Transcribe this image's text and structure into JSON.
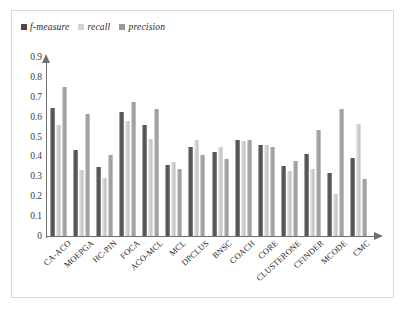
{
  "figure": {
    "background_color": "#ffffff",
    "frame_color": "#d9d9d9"
  },
  "legend": {
    "position": "top-left",
    "entries": [
      {
        "label": "f-measure",
        "color": "#4a4a4a",
        "key": "f_measure"
      },
      {
        "label": "recall",
        "color": "#d2d2d2",
        "key": "recall"
      },
      {
        "label": "precision",
        "color": "#9a9a9a",
        "key": "precision"
      }
    ]
  },
  "axes": {
    "y_ticks": [
      "0",
      "0.1",
      "0.2",
      "0.3",
      "0.4",
      "0.5",
      "0.6",
      "0.7",
      "0.8",
      "0.9"
    ],
    "y_min": 0,
    "y_max": 0.9,
    "x_label": "",
    "y_label": "",
    "grid": "none",
    "axis_color": "#6f6f6f"
  },
  "chart_data": {
    "type": "bar",
    "title": "",
    "subtitle": "",
    "xlabel": "",
    "ylabel": "",
    "ylim": [
      0,
      0.9
    ],
    "grid": false,
    "legend_position": "top-left",
    "categories": [
      "CA-ACO",
      "MOEPGA",
      "HC-PIN",
      "FOCA",
      "ACO-MCL",
      "MCL",
      "DPCLUS",
      "BNSC",
      "COACH",
      "CORE",
      "CLUSTERONE",
      "CFINDER",
      "MCODE",
      "CMC"
    ],
    "series": [
      {
        "name": "f-measure",
        "color": "#4a4a4a",
        "values": [
          0.67,
          0.45,
          0.36,
          0.65,
          0.58,
          0.37,
          0.465,
          0.44,
          0.5,
          0.475,
          0.365,
          0.43,
          0.33,
          0.41
        ]
      },
      {
        "name": "recall",
        "color": "#d2d2d2",
        "values": [
          0.58,
          0.345,
          0.305,
          0.6,
          0.51,
          0.385,
          0.5,
          0.465,
          0.495,
          0.475,
          0.34,
          0.35,
          0.22,
          0.585
        ]
      },
      {
        "name": "precision",
        "color": "#9a9a9a",
        "values": [
          0.78,
          0.64,
          0.425,
          0.7,
          0.665,
          0.35,
          0.425,
          0.405,
          0.5,
          0.465,
          0.39,
          0.555,
          0.665,
          0.3
        ]
      }
    ]
  }
}
